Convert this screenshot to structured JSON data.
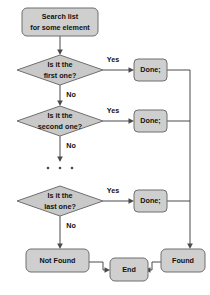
{
  "diagram": {
    "type": "flowchart",
    "background_color": "#ffffff",
    "node_fill_color": "#cfcfcf",
    "diamond_fill_color": "#c9c9c9",
    "node_border_color": "#6e6e6e",
    "edge_color": "#4a4a4a",
    "text_color": "#111111"
  },
  "nodes": {
    "start": {
      "id": "start",
      "shape": "rounded-rect",
      "line1": "Search list",
      "line2": "for some element"
    },
    "decision_first": {
      "id": "decision-first",
      "shape": "diamond",
      "line1": "Is it the",
      "line2": "first one?"
    },
    "decision_second": {
      "id": "decision-second",
      "shape": "diamond",
      "line1": "Is it the",
      "line2": "second one?"
    },
    "decision_last": {
      "id": "decision-last",
      "shape": "diamond",
      "line1": "Is it the",
      "line2": "last one?"
    },
    "done_first": {
      "id": "done-first",
      "shape": "rounded-rect",
      "label": "Done;"
    },
    "done_second": {
      "id": "done-second",
      "shape": "rounded-rect",
      "label": "Done;"
    },
    "done_last": {
      "id": "done-last",
      "shape": "rounded-rect",
      "label": "Done;"
    },
    "not_found": {
      "id": "not-found",
      "shape": "rounded-rect",
      "label": "Not Found"
    },
    "found": {
      "id": "found",
      "shape": "rounded-rect",
      "label": "Found"
    },
    "end": {
      "id": "end",
      "shape": "rounded-rect",
      "label": "End"
    },
    "ellipsis": {
      "id": "ellipsis",
      "shape": "dots",
      "label": "..."
    }
  },
  "edge_labels": {
    "yes_first": "Yes",
    "no_first": "No",
    "yes_second": "Yes",
    "no_second": "No",
    "yes_last": "Yes",
    "no_last": "No"
  }
}
